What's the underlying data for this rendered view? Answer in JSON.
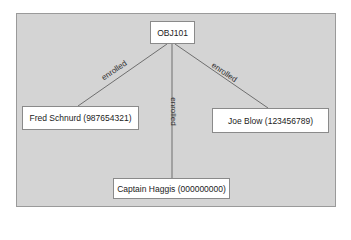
{
  "diagram": {
    "root": {
      "label": "OBJ101"
    },
    "nodes": [
      {
        "label": "Fred Schnurd (987654321)"
      },
      {
        "label": "Joe Blow (123456789)"
      },
      {
        "label": "Captain Haggis (000000000)"
      }
    ],
    "edges": [
      {
        "from": "OBJ101",
        "to": "Fred Schnurd (987654321)",
        "label": "enrolled"
      },
      {
        "from": "OBJ101",
        "to": "Joe Blow (123456789)",
        "label": "enrolled"
      },
      {
        "from": "OBJ101",
        "to": "Captain Haggis (000000000)",
        "label": "enrolled"
      }
    ],
    "colors": {
      "background": "#d4d4d4",
      "node_fill": "#ffffff",
      "edge": "#6f6f6f"
    }
  }
}
